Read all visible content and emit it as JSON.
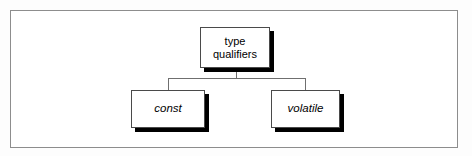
{
  "figure": {
    "kind": "hierarchy-diagram",
    "frame": {
      "border_color": "#8d8d8d",
      "background_color": "#ffffff"
    },
    "page_background": "#fdfdfd"
  },
  "diagram": {
    "root": {
      "id": "type-qualifiers",
      "label": "type\nqualifiers",
      "label_line_1": "type",
      "label_line_2": "qualifiers",
      "style": "regular",
      "fill_color": "#ffffff",
      "border_color": "#4a4a4a",
      "shadow_color": "#000000"
    },
    "children": [
      {
        "id": "const",
        "label": "const",
        "style": "italic",
        "fill_color": "#ffffff",
        "border_color": "#4a4a4a",
        "shadow_color": "#000000"
      },
      {
        "id": "volatile",
        "label": "volatile",
        "style": "italic",
        "fill_color": "#ffffff",
        "border_color": "#4a4a4a",
        "shadow_color": "#000000"
      }
    ],
    "connectors": {
      "line_color": "#6f6f6f",
      "description": "parent stem down to horizontal rail, then drops to each child"
    }
  }
}
